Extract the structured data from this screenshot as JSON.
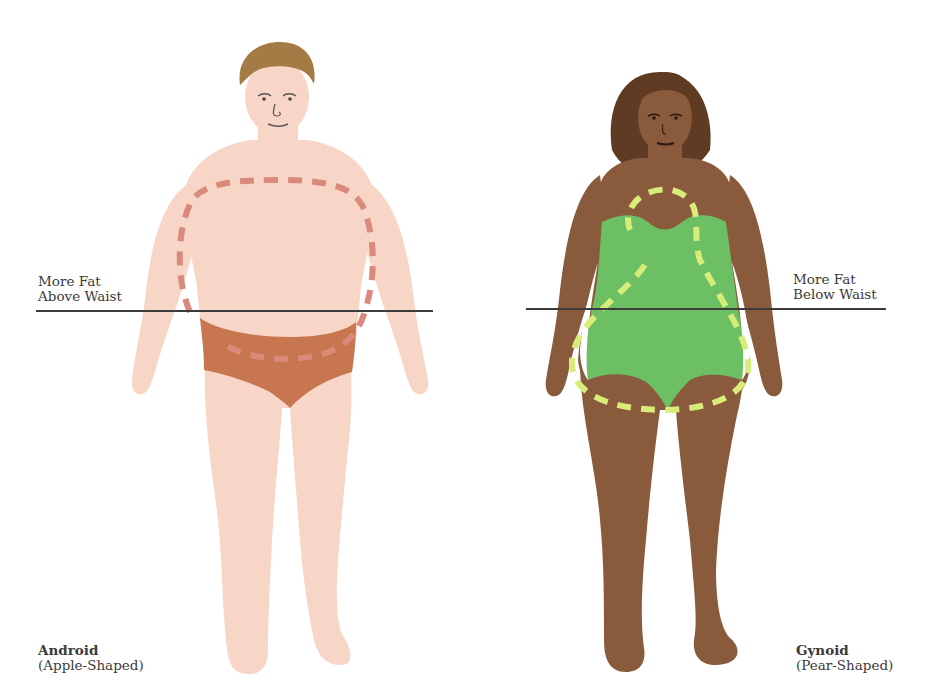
{
  "figures": [
    {
      "id": "android",
      "name": "Android",
      "subtitle": "(Apple-Shaped)",
      "waist_label": [
        "More Fat",
        "Above Waist"
      ],
      "colors": {
        "skin": "#f7d6c7",
        "hair": "#a57b45",
        "garment": "#c7764f",
        "dash_outline": "#d98a7b"
      }
    },
    {
      "id": "gynoid",
      "name": "Gynoid",
      "subtitle": "(Pear-Shaped)",
      "waist_label": [
        "More Fat",
        "Below Waist"
      ],
      "colors": {
        "skin": "#8a5a3c",
        "hair": "#5e3b22",
        "garment": "#6cbf63",
        "dash_outline": "#d8ec7a"
      }
    }
  ],
  "colors": {
    "background": "#ffffff",
    "waist_line": "#3c3c3c",
    "text": "#3a3a3a"
  }
}
